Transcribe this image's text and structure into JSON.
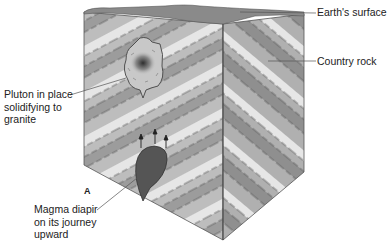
{
  "figure": {
    "panel_label": "A",
    "labels": {
      "earths_surface": "Earth's surface",
      "country_rock": "Country rock",
      "pluton": "Pluton in place\nsolidifying to\ngranite",
      "diapir": "Magma diapir\non its journey\nupward"
    },
    "colors": {
      "band_light": "#e6e6e6",
      "band_mid": "#bdbdbd",
      "band_dark": "#9c9c9c",
      "surface": "#8a8a8a",
      "pluton_fill": "#c8c8c8",
      "pluton_core": "#3a3a3a",
      "diapir_fill": "#555555",
      "outline": "#444444"
    }
  }
}
